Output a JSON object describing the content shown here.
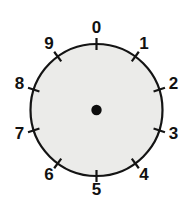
{
  "figure": {
    "background_color": "#ffffff",
    "circle": {
      "center_x": 96.5,
      "center_y": 110,
      "radius": 66,
      "fill_color": "#ebebe9",
      "stroke_color": "#141414",
      "stroke_width": 2.2
    },
    "center_dot": {
      "radius": 5.2,
      "fill_color": "#0d0d0d"
    },
    "ticks": {
      "count": 10,
      "inner_offset": 6,
      "outer_offset": 6,
      "stroke_color": "#141414",
      "stroke_width": 2.2
    },
    "labels": {
      "radius": 81,
      "color": "#111111",
      "items": [
        {
          "text": "0",
          "angle_deg": 0,
          "x": 96.5,
          "y": 29.0
        },
        {
          "text": "1",
          "angle_deg": 36,
          "x": 144.1,
          "y": 44.5
        },
        {
          "text": "2",
          "angle_deg": 72,
          "x": 173.5,
          "y": 85.0
        },
        {
          "text": "3",
          "angle_deg": 108,
          "x": 173.5,
          "y": 135.0
        },
        {
          "text": "4",
          "angle_deg": 144,
          "x": 144.1,
          "y": 175.5
        },
        {
          "text": "5",
          "angle_deg": 180,
          "x": 96.5,
          "y": 191.0
        },
        {
          "text": "6",
          "angle_deg": 216,
          "x": 48.9,
          "y": 175.5
        },
        {
          "text": "7",
          "angle_deg": 252,
          "x": 19.5,
          "y": 135.0
        },
        {
          "text": "8",
          "angle_deg": 288,
          "x": 19.5,
          "y": 85.0
        },
        {
          "text": "9",
          "angle_deg": 324,
          "x": 48.9,
          "y": 44.5
        }
      ]
    }
  }
}
